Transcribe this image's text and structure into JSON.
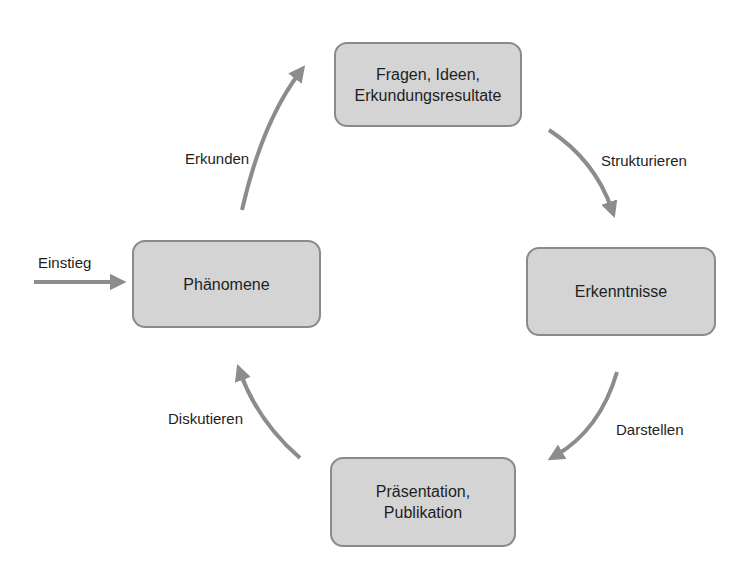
{
  "diagram": {
    "type": "cycle",
    "colors": {
      "box_fill": "#d4d4d4",
      "box_border": "#8a8a8a",
      "arrow": "#8c8c8c",
      "text": "#1e1e1e"
    },
    "entry": {
      "label": "Einstieg",
      "target": "phaenomene"
    },
    "nodes": [
      {
        "id": "fragen",
        "label": "Fragen, Ideen,\nErkundungsresultate"
      },
      {
        "id": "erkenntnisse",
        "label": "Erkenntnisse"
      },
      {
        "id": "praesentation",
        "label": "Präsentation,\nPublikation"
      },
      {
        "id": "phaenomene",
        "label": "Phänomene"
      }
    ],
    "edges": [
      {
        "from": "phaenomene",
        "to": "fragen",
        "label": "Erkunden"
      },
      {
        "from": "fragen",
        "to": "erkenntnisse",
        "label": "Strukturieren"
      },
      {
        "from": "erkenntnisse",
        "to": "praesentation",
        "label": "Darstellen"
      },
      {
        "from": "praesentation",
        "to": "phaenomene",
        "label": "Diskutieren"
      }
    ]
  }
}
